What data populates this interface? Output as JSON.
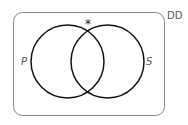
{
  "diagram": {
    "type": "venn",
    "universe_label": "DD",
    "sets": [
      {
        "name": "P",
        "label": "P"
      },
      {
        "name": "S",
        "label": "S"
      }
    ],
    "marker": {
      "symbol": "*",
      "position": "top intersection of P and S"
    }
  },
  "colors": {
    "circle_stroke": "#111111",
    "box_stroke": "#888888",
    "text": "#555555"
  }
}
